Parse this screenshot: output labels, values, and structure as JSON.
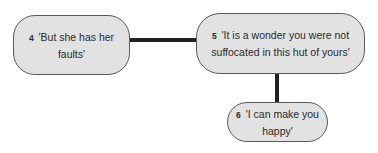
{
  "diagram": {
    "type": "tree",
    "colors": {
      "node_fill": "#e2e2e2",
      "node_border": "#5a5a5a",
      "connector": "#222222",
      "text": "#2a2a2a"
    },
    "nodes": [
      {
        "id": "4",
        "number": "4",
        "text": "'But she has her faults'"
      },
      {
        "id": "5",
        "number": "5",
        "text": "'It is a wonder you were not suffocated in this hut of yours'"
      },
      {
        "id": "6",
        "number": "6",
        "text": "'I can make you happy'"
      }
    ],
    "edges": [
      {
        "from": "4",
        "to": "5"
      },
      {
        "from": "5",
        "to": "6"
      }
    ]
  }
}
